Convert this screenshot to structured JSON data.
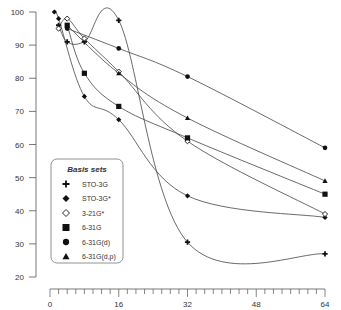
{
  "chart_data": {
    "type": "line",
    "title": "",
    "xlabel": "",
    "ylabel": "",
    "xlim": [
      0,
      64
    ],
    "ylim": [
      20,
      100
    ],
    "x_ticks": [
      0,
      16,
      32,
      48,
      64
    ],
    "x_minor_tick_step": 2,
    "y_ticks": [
      20,
      30,
      40,
      50,
      60,
      70,
      80,
      90,
      100
    ],
    "grid": false,
    "legend": {
      "title": "Basis sets",
      "position": "lower-left inside plot"
    },
    "series": [
      {
        "name": "STO-3G",
        "marker": "plus",
        "x": [
          2,
          4,
          8,
          16,
          32,
          64
        ],
        "values": [
          96,
          91,
          91,
          97.5,
          30.5,
          27
        ]
      },
      {
        "name": "STO-3G*",
        "marker": "filled-diamond",
        "x": [
          1,
          2,
          8,
          16,
          32,
          64
        ],
        "values": [
          100,
          98,
          74.5,
          67.5,
          44.5,
          38
        ]
      },
      {
        "name": "3-21G*",
        "marker": "open-diamond",
        "x": [
          2,
          4,
          8,
          16,
          32,
          64
        ],
        "values": [
          95,
          98,
          92,
          82,
          61,
          39
        ]
      },
      {
        "name": "6-31G",
        "marker": "filled-square",
        "x": [
          4,
          8,
          16,
          32,
          64
        ],
        "values": [
          96,
          81.5,
          71.5,
          62,
          45
        ]
      },
      {
        "name": "6-31G(d)",
        "marker": "filled-circle",
        "x": [
          4,
          16,
          32,
          64
        ],
        "values": [
          95,
          89,
          80.5,
          59
        ]
      },
      {
        "name": "6-31G(d,p)",
        "marker": "filled-triangle",
        "x": [
          4,
          16,
          32,
          64
        ],
        "values": [
          96,
          81.5,
          68,
          49
        ]
      }
    ]
  },
  "legend": {
    "title": "Basis sets",
    "items": [
      "STO-3G",
      "STO-3G*",
      "3-21G*",
      "6-31G",
      "6-31G(d)",
      "6-31G(d,p)"
    ]
  },
  "axes": {
    "x_tick_labels": [
      "0",
      "16",
      "32",
      "48",
      "64"
    ],
    "y_tick_labels": [
      "100",
      "90",
      "80",
      "70",
      "60",
      "50",
      "40",
      "30",
      "20"
    ]
  },
  "colors": {
    "line": "#444444",
    "marker": "#111111",
    "axis": "#555555"
  }
}
